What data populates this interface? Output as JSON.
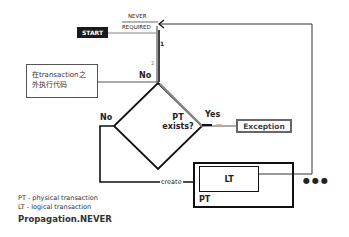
{
  "diagram": {
    "start_label": "START",
    "branch_labels": {
      "never": "NEVER",
      "required": "REQUIRED"
    },
    "step_markers": [
      "1",
      "2"
    ],
    "decision": {
      "label_line1": "PT",
      "label_line2": "exists?"
    },
    "edge_labels": {
      "no_top": "No",
      "no_left": "No",
      "yes": "Yes",
      "create": "create",
      "ellipsis": "..."
    },
    "outside_tx_box": {
      "line1": "在transaction之",
      "line2": "外执行代码"
    },
    "exception_box": "Exception",
    "pt_box_label": "PT",
    "lt_box_label": "LT",
    "more": "●●●",
    "legend": [
      "PT - physical transaction",
      "LT - logical transaction"
    ],
    "title": "Propagation.NEVER"
  }
}
